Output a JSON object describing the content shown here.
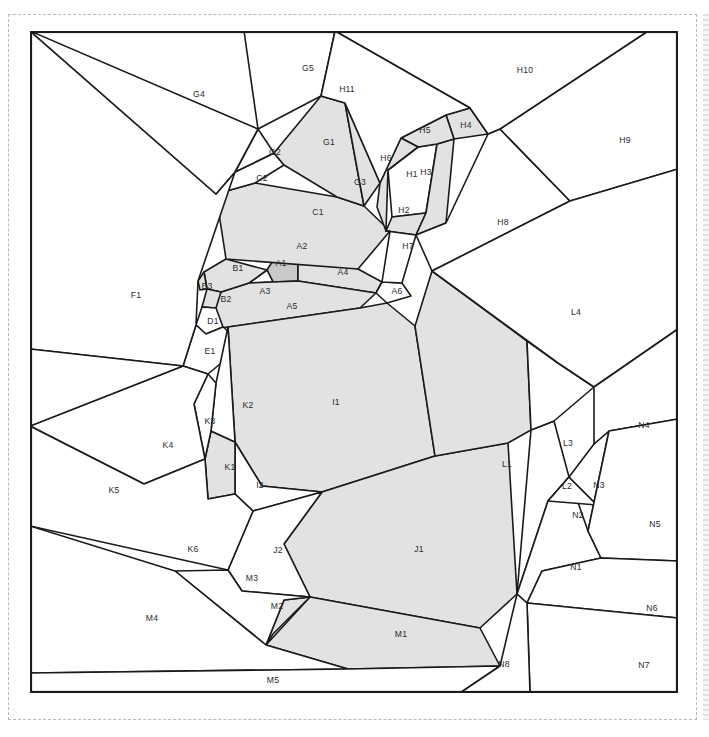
{
  "page": {
    "top_caption": "",
    "background_color": "#ffffff",
    "frame_color": "#b9b9b9",
    "line_color": "#1a1a1a",
    "shade_color": "#e2e2e2",
    "shade_dark_color": "#c9c9c9",
    "label_color": "#2b2b2b"
  },
  "diagram": {
    "type": "parcel-subdivision-map",
    "outline": "0,0 648,0 648,662 0,662",
    "region_count": 63,
    "shaded_count": 21,
    "regions": [
      {
        "id": "A1",
        "label": "A1",
        "shade": "dark",
        "lx": 251,
        "ly": 233,
        "points": "237,239 248,222 268,224 268,250 243,251"
      },
      {
        "id": "A2",
        "label": "A2",
        "shade": "light",
        "lx": 272,
        "ly": 216,
        "points": "196,228 248,222 300,232 328,238 268,224"
      },
      {
        "id": "A3",
        "label": "A3",
        "shade": "none",
        "lx": 235,
        "ly": 261,
        "points": "219,252 237,239 243,251"
      },
      {
        "id": "A4",
        "label": "A4",
        "shade": "light",
        "lx": 313,
        "ly": 242,
        "points": "268,250 268,224 328,238 352,251 346,262"
      },
      {
        "id": "A5",
        "label": "A5",
        "shade": "light",
        "lx": 262,
        "ly": 276,
        "points": "191,261 219,252 243,251 268,250 346,262 330,277 198,296 161,300"
      },
      {
        "id": "A6",
        "label": "A6",
        "shade": "none",
        "lx": 367,
        "ly": 261,
        "points": "346,262 352,251 372,252 381,265 357,272"
      },
      {
        "id": "B1",
        "label": "B1",
        "shade": "light",
        "lx": 208,
        "ly": 238,
        "points": "174,241 196,228 237,239 219,252 191,261 177,258"
      },
      {
        "id": "B2",
        "label": "B2",
        "shade": "light",
        "lx": 196,
        "ly": 269,
        "points": "177,258 191,261 186,277 172,276"
      },
      {
        "id": "B3",
        "label": "B3",
        "shade": "light",
        "lx": 177,
        "ly": 256,
        "points": "168,250 174,241 177,258 170,259"
      },
      {
        "id": "C1",
        "label": "C1",
        "shade": "light",
        "lx": 288,
        "ly": 182,
        "points": "186,163 225,152 307,166 334,175 360,200 328,238 196,228"
      },
      {
        "id": "C2",
        "label": "C2",
        "shade": "none",
        "lx": 232,
        "ly": 148,
        "points": "205,141 244,122 254,134 225,152 186,163"
      },
      {
        "id": "D1",
        "label": "D1",
        "shade": "none",
        "lx": 183,
        "ly": 291,
        "points": "172,276 186,277 193,296 176,303 166,294"
      },
      {
        "id": "E1",
        "label": "E1",
        "shade": "none",
        "lx": 180,
        "ly": 321,
        "points": "166,294 176,303 193,296 214,313 178,343 153,335"
      },
      {
        "id": "F1",
        "label": "F1",
        "shade": "none",
        "lx": 106,
        "ly": 265,
        "points": "0,0 186,163 205,141 168,250 166,294 153,335 0,318"
      },
      {
        "id": "G1",
        "label": "G1",
        "shade": "light",
        "lx": 299,
        "ly": 112,
        "points": "244,122 291,65 315,72 334,175 307,166 254,134"
      },
      {
        "id": "G2",
        "label": "G2",
        "shade": "none",
        "lx": 245,
        "ly": 122,
        "points": "205,141 228,98 244,122"
      },
      {
        "id": "G3",
        "label": "G3",
        "shade": "light",
        "lx": 330,
        "ly": 152,
        "points": "334,175 315,72 350,152"
      },
      {
        "id": "G4",
        "label": "G4",
        "shade": "none",
        "lx": 169,
        "ly": 64,
        "points": "0,0 228,98 205,141 186,163"
      },
      {
        "id": "G5",
        "label": "G5",
        "shade": "none",
        "lx": 278,
        "ly": 38,
        "points": "228,98 214,0 305,0 291,65"
      },
      {
        "id": "H1",
        "label": "H1",
        "shade": "none",
        "lx": 382,
        "ly": 144,
        "points": "358,139 388,116 407,113 396,182 362,186"
      },
      {
        "id": "H2",
        "label": "H2",
        "shade": "light",
        "lx": 374,
        "ly": 180,
        "points": "362,186 396,182 386,204 356,200"
      },
      {
        "id": "H3",
        "label": "H3",
        "shade": "light",
        "lx": 396,
        "ly": 142,
        "points": "407,113 424,108 416,192 386,204 396,182"
      },
      {
        "id": "H4",
        "label": "H4",
        "shade": "light",
        "lx": 436,
        "ly": 95,
        "points": "416,84 440,77 458,103 424,108"
      },
      {
        "id": "H5",
        "label": "H5",
        "shade": "light",
        "lx": 395,
        "ly": 100,
        "points": "371,107 416,84 424,108 407,113 388,116"
      },
      {
        "id": "H6",
        "label": "H6",
        "shade": "light",
        "lx": 356,
        "ly": 128,
        "points": "350,152 371,107 388,116 358,139 356,200 347,176"
      },
      {
        "id": "H7",
        "label": "H7",
        "shade": "none",
        "lx": 378,
        "ly": 216,
        "points": "356,200 386,204 372,252 352,251 360,200"
      },
      {
        "id": "H8",
        "label": "H8",
        "shade": "none",
        "lx": 473,
        "ly": 192,
        "points": "416,192 458,103 470,98 540,170 402,240 386,204"
      },
      {
        "id": "H9",
        "label": "H9",
        "shade": "none",
        "lx": 595,
        "ly": 110,
        "points": "470,98 618,0 648,0 648,138 540,170"
      },
      {
        "id": "H10",
        "label": "H10",
        "shade": "none",
        "lx": 495,
        "ly": 40,
        "points": "305,0 618,0 470,98 458,103 440,77"
      },
      {
        "id": "H11",
        "label": "H11",
        "shade": "none",
        "lx": 317,
        "ly": 59,
        "points": "305,0 440,77 416,84 371,107 350,152 315,72 291,65"
      },
      {
        "id": "I1",
        "label": "I1",
        "shade": "light",
        "lx": 306,
        "ly": 372,
        "points": "198,296 330,277 357,272 385,295 405,425 292,461 232,455 205,411"
      },
      {
        "id": "I2",
        "label": "I2",
        "shade": "none",
        "lx": 230,
        "ly": 455,
        "points": "205,411 232,455 292,461 223,480 205,463"
      },
      {
        "id": "J1",
        "label": "J1",
        "shade": "light",
        "lx": 389,
        "ly": 519,
        "points": "292,461 405,425 478,412 487,563 450,597 280,566 254,513"
      },
      {
        "id": "J2",
        "label": "J2",
        "shade": "none",
        "lx": 248,
        "ly": 520,
        "points": "223,480 292,461 254,513 280,566 212,560 198,539"
      },
      {
        "id": "K1",
        "label": "K1",
        "shade": "light",
        "lx": 200,
        "ly": 437,
        "points": "181,400 205,411 205,463 178,468 175,428"
      },
      {
        "id": "K2",
        "label": "K2",
        "shade": "none",
        "lx": 218,
        "ly": 375,
        "points": "198,296 205,411 181,400 186,352"
      },
      {
        "id": "K3",
        "label": "K3",
        "shade": "none",
        "lx": 180,
        "ly": 391,
        "points": "178,343 186,352 181,400 175,428 164,373"
      },
      {
        "id": "K4",
        "label": "K4",
        "shade": "none",
        "lx": 138,
        "ly": 415,
        "points": "153,335 178,343 164,373 175,428 114,453 0,395"
      },
      {
        "id": "K5",
        "label": "K5",
        "shade": "none",
        "lx": 84,
        "ly": 460,
        "points": "0,318 153,335 0,395"
      },
      {
        "id": "K6",
        "label": "K6",
        "shade": "none",
        "lx": 163,
        "ly": 519,
        "points": "0,395 114,453 175,428 178,468 205,463 223,480 198,539 0,495"
      },
      {
        "id": "L1",
        "label": "L1",
        "shade": "light",
        "lx": 477,
        "ly": 434,
        "points": "385,295 402,240 497,310 501,399 478,412 405,425"
      },
      {
        "id": "L2",
        "label": "L2",
        "shade": "none",
        "lx": 537,
        "ly": 456,
        "points": "501,399 524,390 539,446 518,470 487,563"
      },
      {
        "id": "L3",
        "label": "L3",
        "shade": "none",
        "lx": 538,
        "ly": 413,
        "points": "497,310 528,332 564,356 524,390 501,399"
      },
      {
        "id": "L4",
        "label": "L4",
        "shade": "none",
        "lx": 546,
        "ly": 282,
        "points": "402,240 540,170 648,138 648,298 564,356 528,332"
      },
      {
        "id": "M1",
        "label": "M1",
        "shade": "light",
        "lx": 371,
        "ly": 604,
        "points": "280,566 450,597 470,635 318,638 236,614"
      },
      {
        "id": "M2",
        "label": "M2",
        "shade": "light",
        "lx": 247,
        "ly": 576,
        "points": "236,614 254,569 280,566 243,603"
      },
      {
        "id": "M3",
        "label": "M3",
        "shade": "none",
        "lx": 222,
        "ly": 548,
        "points": "198,539 212,560 280,566 254,569 236,614 145,540"
      },
      {
        "id": "M4",
        "label": "M4",
        "shade": "none",
        "lx": 122,
        "ly": 588,
        "points": "0,495 145,540 236,614 318,638 0,642"
      },
      {
        "id": "M5",
        "label": "M5",
        "shade": "none",
        "lx": 243,
        "ly": 650,
        "points": "0,642 318,638 470,635 430,662 0,662"
      },
      {
        "id": "N1",
        "label": "N1",
        "shade": "none",
        "lx": 546,
        "ly": 537,
        "points": "487,563 518,470 539,446 558,500 571,527 512,540 497,572"
      },
      {
        "id": "N2",
        "label": "N2",
        "shade": "none",
        "lx": 548,
        "ly": 485,
        "points": "518,470 539,446 567,474"
      },
      {
        "id": "N3",
        "label": "N3",
        "shade": "none",
        "lx": 569,
        "ly": 455,
        "points": "539,446 564,413 579,400 558,500 567,474"
      },
      {
        "id": "N4",
        "label": "N4",
        "shade": "none",
        "lx": 614,
        "ly": 395,
        "points": "564,356 648,298 648,388 579,400 564,413"
      },
      {
        "id": "N5",
        "label": "N5",
        "shade": "none",
        "lx": 625,
        "ly": 494,
        "points": "579,400 648,388 648,530 571,527 558,500"
      },
      {
        "id": "N6",
        "label": "N6",
        "shade": "none",
        "lx": 622,
        "ly": 578,
        "points": "571,527 648,530 648,587 497,572 512,540"
      },
      {
        "id": "N7",
        "label": "N7",
        "shade": "none",
        "lx": 614,
        "ly": 635,
        "points": "497,572 648,587 648,662 500,662"
      },
      {
        "id": "N8",
        "label": "N8",
        "shade": "none",
        "lx": 474,
        "ly": 634,
        "points": "470,635 487,563 497,572 500,662 430,662"
      }
    ]
  }
}
